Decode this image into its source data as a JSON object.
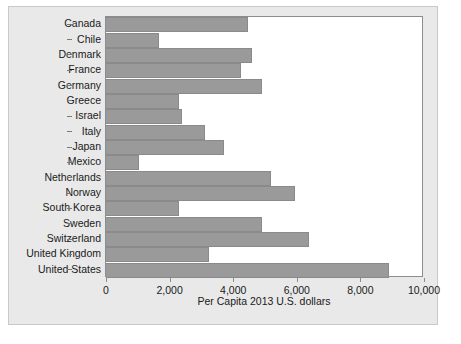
{
  "chart_data": {
    "type": "bar",
    "orientation": "horizontal",
    "title": "",
    "xlabel": "Per Capita 2013 U.S. dollars",
    "ylabel": "",
    "xlim": [
      0,
      10000
    ],
    "xticks": [
      0,
      2000,
      4000,
      6000,
      8000,
      10000
    ],
    "xticklabels": [
      "0",
      "2,000",
      "4,000",
      "6,000",
      "8,000",
      "10,000"
    ],
    "grid": false,
    "legend": false,
    "bar_color": "#9a9a9a",
    "bar_edge_color": "#8a8a8a",
    "panel_color": "#e9e9e9",
    "plot_bg_color": "#ffffff",
    "axis_color": "#8c8c8c",
    "categories": [
      "Canada",
      "Chile",
      "Denmark",
      "France",
      "Germany",
      "Greece",
      "Israel",
      "Italy",
      "Japan",
      "Mexico",
      "Netherlands",
      "Norway",
      "South Korea",
      "Sweden",
      "Switzerland",
      "United Kingdom",
      "United States"
    ],
    "values": [
      4480,
      1670,
      4600,
      4260,
      4890,
      2300,
      2400,
      3100,
      3720,
      1050,
      5180,
      5930,
      2300,
      4920,
      6370,
      3250,
      8900
    ]
  }
}
